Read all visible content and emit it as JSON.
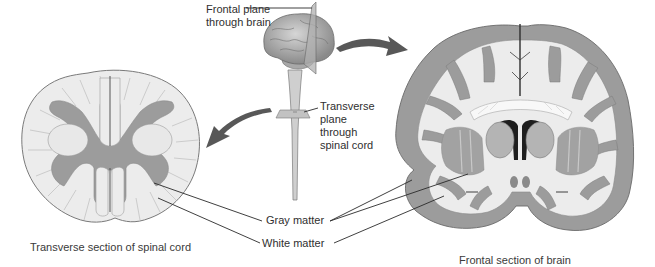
{
  "diagram": {
    "labels": {
      "frontal_plane": [
        "Frontal plane",
        "through brain"
      ],
      "transverse_plane": [
        "Transverse",
        "plane",
        "through",
        "spinal cord"
      ],
      "gray_matter": "Gray matter",
      "white_matter": "White matter"
    },
    "captions": {
      "spinal_cord": "Transverse section of spinal cord",
      "brain": "Frontal section of brain"
    },
    "figures": [
      {
        "name": "whole-brain-with-spinal-cord",
        "description": "Lateral view of brain and spinal cord showing section planes"
      },
      {
        "name": "spinal-cord-transverse-section",
        "description": "Cross-section with butterfly-shaped gray matter surrounded by white matter"
      },
      {
        "name": "brain-frontal-section",
        "description": "Coronal section with outer gray cortex, inner white matter and deep gray nuclei"
      }
    ],
    "arrows": [
      {
        "from": "brain",
        "to": "brain-frontal-section",
        "direction": "right"
      },
      {
        "from": "spinal-cord",
        "to": "spinal-cord-transverse-section",
        "direction": "left-down"
      }
    ],
    "colors": {
      "gray_matter": "#9a9a9a",
      "white_matter": "#ececec",
      "outline": "#6a6a6a",
      "arrow": "#555555",
      "text": "#2f2f2f"
    }
  }
}
